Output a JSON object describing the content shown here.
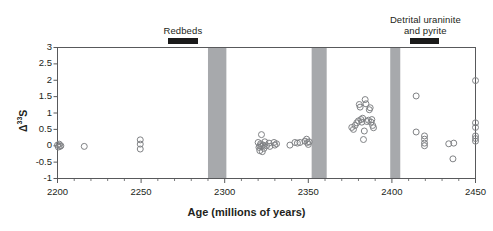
{
  "figure": {
    "background_color": "#ffffff",
    "axis_color": "#58595b",
    "marker_edge_color": "#808285",
    "band_color": "#a7a9ac",
    "annotation_bar_color": "#1a1a1a"
  },
  "annotations": [
    {
      "name": "redbeds",
      "label": "Redbeds",
      "x_start": 2266,
      "x_end": 2284,
      "text_center_x": 2275
    },
    {
      "name": "detrital-uraninite-and-pyrite",
      "label": "Detrital uraninite\nand pyrite",
      "x_start": 2411,
      "x_end": 2428,
      "text_center_x": 2420
    }
  ],
  "shaded_bands": [
    {
      "name": "band-2290-2300",
      "x_start": 2290,
      "x_end": 2301
    },
    {
      "name": "band-2352-2360",
      "x_start": 2352,
      "x_end": 2361
    },
    {
      "name": "band-2399-2405",
      "x_start": 2399,
      "x_end": 2405
    }
  ],
  "chart_data": {
    "type": "scatter",
    "title": "",
    "xlabel": "Age (millions of years)",
    "ylabel": "Δ33S",
    "ylabel_base": "Δ",
    "ylabel_sup": "33",
    "ylabel_tail": "S",
    "xlim": [
      2200,
      2450
    ],
    "ylim": [
      -1,
      3
    ],
    "xticks": [
      2200,
      2250,
      2300,
      2350,
      2400,
      2450
    ],
    "xticklabels": [
      "2200",
      "2250",
      "2300",
      "2350",
      "2400",
      "2450"
    ],
    "xminorticks": [
      2210,
      2220,
      2230,
      2240,
      2260,
      2270,
      2280,
      2290,
      2310,
      2320,
      2330,
      2340,
      2360,
      2370,
      2380,
      2390,
      2410,
      2420,
      2430,
      2440
    ],
    "yticks": [
      -1,
      -0.5,
      0,
      0.5,
      1,
      1.5,
      2,
      2.5,
      3
    ],
    "yticklabels": [
      "-1",
      "-0.5",
      "0",
      "0.5",
      "1",
      "1.5",
      "2",
      "2.5",
      "3"
    ],
    "grid": false,
    "legend": null,
    "marker": "open-circle",
    "marker_size_px": 6,
    "series": [
      {
        "name": "Delta33S measurements",
        "points": [
          [
            2200.0,
            0.02
          ],
          [
            2200.5,
            -0.04
          ],
          [
            2201.0,
            0.05
          ],
          [
            2201.5,
            -0.02
          ],
          [
            2202.0,
            0.0
          ],
          [
            2216.0,
            -0.02
          ],
          [
            2249.5,
            0.18
          ],
          [
            2249.5,
            0.05
          ],
          [
            2249.5,
            -0.1
          ],
          [
            2320.0,
            0.1
          ],
          [
            2320.5,
            -0.05
          ],
          [
            2321.0,
            0.0
          ],
          [
            2321.0,
            -0.15
          ],
          [
            2321.5,
            0.06
          ],
          [
            2322.0,
            0.34
          ],
          [
            2322.0,
            -0.02
          ],
          [
            2322.5,
            -0.18
          ],
          [
            2323.0,
            0.02
          ],
          [
            2323.5,
            -0.08
          ],
          [
            2324.0,
            0.12
          ],
          [
            2325.0,
            0.0
          ],
          [
            2326.5,
            0.08
          ],
          [
            2327.0,
            -0.02
          ],
          [
            2329.5,
            0.1
          ],
          [
            2330.0,
            0.02
          ],
          [
            2331.0,
            0.06
          ],
          [
            2339.0,
            0.02
          ],
          [
            2342.0,
            0.1
          ],
          [
            2343.5,
            0.08
          ],
          [
            2345.0,
            0.1
          ],
          [
            2348.0,
            0.14
          ],
          [
            2349.0,
            0.2
          ],
          [
            2349.5,
            0.1
          ],
          [
            2350.0,
            0.04
          ],
          [
            2350.5,
            0.12
          ],
          [
            2376.0,
            0.56
          ],
          [
            2377.0,
            0.5
          ],
          [
            2378.0,
            0.62
          ],
          [
            2379.0,
            0.7
          ],
          [
            2380.0,
            0.76
          ],
          [
            2380.5,
            1.26
          ],
          [
            2381.0,
            1.18
          ],
          [
            2381.5,
            0.8
          ],
          [
            2382.0,
            0.72
          ],
          [
            2382.5,
            0.84
          ],
          [
            2383.0,
            0.19
          ],
          [
            2383.5,
            0.45
          ],
          [
            2384.0,
            1.41
          ],
          [
            2384.5,
            1.28
          ],
          [
            2385.0,
            0.74
          ],
          [
            2386.0,
            0.78
          ],
          [
            2386.5,
            1.1
          ],
          [
            2387.0,
            1.16
          ],
          [
            2387.5,
            0.72
          ],
          [
            2388.0,
            0.8
          ],
          [
            2388.5,
            0.62
          ],
          [
            2389.0,
            0.55
          ],
          [
            2414.5,
            1.52
          ],
          [
            2414.5,
            0.42
          ],
          [
            2419.5,
            0.3
          ],
          [
            2419.5,
            0.2
          ],
          [
            2419.5,
            0.08
          ],
          [
            2419.5,
            0.0
          ],
          [
            2434.0,
            0.06
          ],
          [
            2437.0,
            0.08
          ],
          [
            2436.5,
            -0.4
          ],
          [
            2450.0,
            1.99
          ],
          [
            2450.0,
            0.7
          ],
          [
            2450.0,
            0.56
          ],
          [
            2450.0,
            0.3
          ],
          [
            2450.0,
            0.22
          ],
          [
            2450.0,
            0.14
          ]
        ]
      }
    ]
  }
}
